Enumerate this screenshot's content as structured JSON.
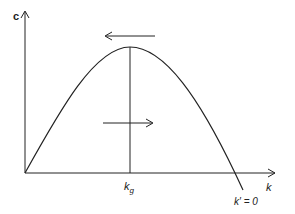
{
  "diagram": {
    "y_axis_label": "c",
    "x_axis_label": "k",
    "peak_label_base": "k",
    "peak_label_sub": "g",
    "nullcline_label": "k′ = 0",
    "arrows": [
      {
        "position": "above-peak",
        "direction": "left"
      },
      {
        "position": "below-curve",
        "direction": "right"
      }
    ],
    "colors": {
      "line": "#222222",
      "background": "#ffffff"
    }
  }
}
